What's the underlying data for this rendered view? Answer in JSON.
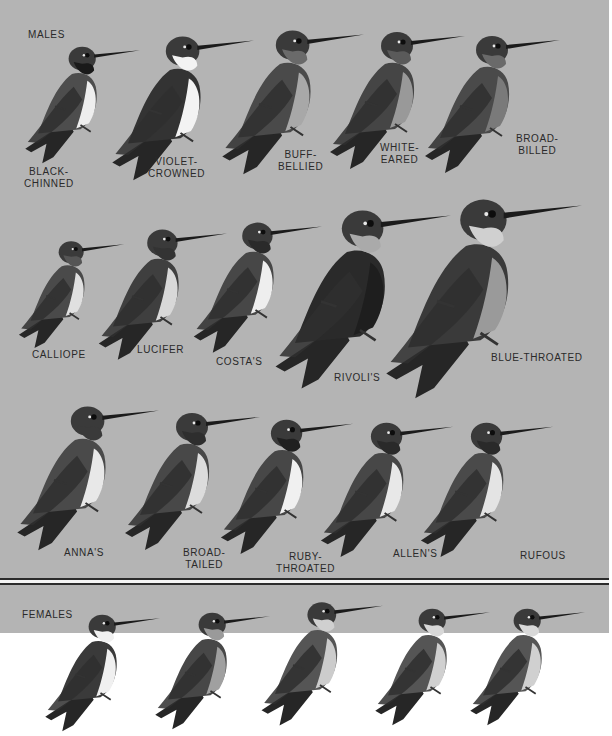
{
  "plate": {
    "background": "#b4b4b4",
    "sections": {
      "males": "MALES",
      "females": "FEMALES"
    },
    "rows": [
      {
        "birds": [
          {
            "name": "BLACK-\nCHINNED",
            "x": 80,
            "y": 40,
            "scale": 0.85,
            "throat": "#1a1a1a",
            "belly": "#eeeeee",
            "back": "#4d4d4d"
          },
          {
            "name": "VIOLET-\nCROWNED",
            "x": 180,
            "y": 28,
            "scale": 1.05,
            "throat": "#f3f3f3",
            "belly": "#f3f3f3",
            "back": "#333333"
          },
          {
            "name": "BUFF-\nBELLIED",
            "x": 290,
            "y": 22,
            "scale": 1.05,
            "throat": "#6a6a6a",
            "belly": "#a8a8a8",
            "back": "#4a4a4a"
          },
          {
            "name": "WHITE-\nEARED",
            "x": 395,
            "y": 24,
            "scale": 1.0,
            "throat": "#5a5a5a",
            "belly": "#999999",
            "back": "#454545"
          },
          {
            "name": "BROAD-\nBILLED",
            "x": 490,
            "y": 28,
            "scale": 1.0,
            "throat": "#6a6a6a",
            "belly": "#7a7a7a",
            "back": "#4a4a4a"
          }
        ],
        "labels": [
          {
            "text": "BLACK-\nCHINNED",
            "x": 24,
            "y": 166
          },
          {
            "text": "VIOLET-\nCROWNED",
            "x": 148,
            "y": 156
          },
          {
            "text": "BUFF-\nBELLIED",
            "x": 278,
            "y": 149
          },
          {
            "text": "WHITE-\nEARED",
            "x": 380,
            "y": 142
          },
          {
            "text": "BROAD-\nBILLED",
            "x": 516,
            "y": 133
          }
        ]
      },
      {
        "birds": [
          {
            "x": 70,
            "y": 235,
            "scale": 0.78,
            "throat": "#555555",
            "belly": "#e0e0e0",
            "back": "#4a4a4a"
          },
          {
            "x": 160,
            "y": 222,
            "scale": 0.95,
            "throat": "#333333",
            "belly": "#d8d8d8",
            "back": "#3f3f3f"
          },
          {
            "x": 255,
            "y": 215,
            "scale": 0.95,
            "throat": "#2a2a2a",
            "belly": "#eeeeee",
            "back": "#474747"
          },
          {
            "x": 360,
            "y": 200,
            "scale": 1.3,
            "throat": "#aaaaaa",
            "belly": "#1e1e1e",
            "back": "#2a2a2a"
          },
          {
            "x": 480,
            "y": 188,
            "scale": 1.45,
            "throat": "#d0d0d0",
            "belly": "#9a9a9a",
            "back": "#3a3a3a"
          }
        ],
        "labels": [
          {
            "text": "CALLIOPE",
            "x": 32,
            "y": 349
          },
          {
            "text": "LUCIFER",
            "x": 137,
            "y": 344
          },
          {
            "text": "COSTA'S",
            "x": 216,
            "y": 356
          },
          {
            "text": "RIVOLI'S",
            "x": 334,
            "y": 372
          },
          {
            "text": "BLUE-THROATED",
            "x": 491,
            "y": 352
          }
        ]
      },
      {
        "birds": [
          {
            "x": 85,
            "y": 398,
            "scale": 1.05,
            "throat": "#3a3a3a",
            "belly": "#e8e8e8",
            "back": "#4a4a4a"
          },
          {
            "x": 190,
            "y": 405,
            "scale": 1.0,
            "throat": "#2e2e2e",
            "belly": "#dcdcdc",
            "back": "#484848"
          },
          {
            "x": 285,
            "y": 412,
            "scale": 0.98,
            "throat": "#202020",
            "belly": "#f0f0f0",
            "back": "#474747"
          },
          {
            "x": 385,
            "y": 415,
            "scale": 0.98,
            "throat": "#2a2a2a",
            "belly": "#e8e8e8",
            "back": "#474747"
          },
          {
            "x": 485,
            "y": 415,
            "scale": 0.98,
            "throat": "#2a2a2a",
            "belly": "#e4e4e4",
            "back": "#4a4a4a"
          }
        ],
        "labels": [
          {
            "text": "ANNA'S",
            "x": 64,
            "y": 547
          },
          {
            "text": "BROAD-\nTAILED",
            "x": 183,
            "y": 547
          },
          {
            "text": "RUBY-\nTHROATED",
            "x": 276,
            "y": 551
          },
          {
            "text": "ALLEN'S",
            "x": 393,
            "y": 548
          },
          {
            "text": "RUFOUS",
            "x": 520,
            "y": 550
          }
        ]
      },
      {
        "birds": [
          {
            "x": 100,
            "y": 608,
            "scale": 0.85,
            "throat": "#f0f0f0",
            "belly": "#f0f0f0",
            "back": "#3a3a3a"
          },
          {
            "x": 210,
            "y": 606,
            "scale": 0.85,
            "throat": "#9a9a9a",
            "belly": "#a0a0a0",
            "back": "#474747"
          },
          {
            "x": 320,
            "y": 595,
            "scale": 0.9,
            "throat": "#d0d0d0",
            "belly": "#cccccc",
            "back": "#555555"
          },
          {
            "x": 430,
            "y": 602,
            "scale": 0.85,
            "throat": "#d8d8d8",
            "belly": "#d0d0d0",
            "back": "#555555"
          },
          {
            "x": 525,
            "y": 602,
            "scale": 0.85,
            "throat": "#d8d8d8",
            "belly": "#d0d0d0",
            "back": "#555555"
          }
        ]
      }
    ],
    "separator": {
      "dark": "#2b2b2b",
      "light": "#f4f4f4"
    }
  }
}
